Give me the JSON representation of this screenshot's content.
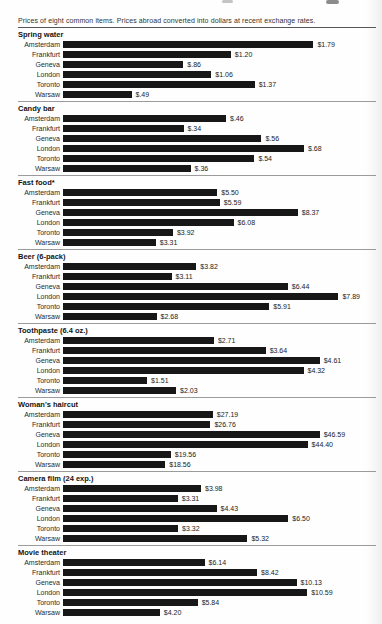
{
  "page": {
    "caption": "Prices of eight common items. Prices abroad converted into dollars at recent exchange rates."
  },
  "colors": {
    "bar": "#171717",
    "section_rule": "#9b9b9b",
    "caption_rule": "#565656",
    "text": "#1f1f1f"
  },
  "chart_data": {
    "type": "bar",
    "orientation": "horizontal",
    "title": "Prices of eight common items. Prices abroad converted into dollars at recent exchange rates.",
    "unit": "USD",
    "grid": false,
    "legend": "none",
    "categories": [
      "Amsterdam",
      "Frankfurt",
      "Geneva",
      "London",
      "Toronto",
      "Warsaw"
    ],
    "groups": [
      {
        "label": "Spring water",
        "values": [
          1.79,
          1.2,
          0.86,
          1.06,
          1.37,
          0.49
        ],
        "value_labels": [
          "$1.79",
          "$1.20",
          "$.86",
          "$1.06",
          "$1.37",
          "$.49"
        ],
        "bar_scale": 0.8
      },
      {
        "label": "Candy bar",
        "values": [
          0.46,
          0.34,
          0.56,
          0.68,
          0.54,
          0.36
        ],
        "value_labels": [
          "$.46",
          "$.34",
          "$.56",
          "$.68",
          "$.54",
          "$.36"
        ],
        "bar_scale": 0.77
      },
      {
        "label": "Fast food*",
        "values": [
          5.5,
          5.59,
          8.37,
          6.08,
          3.92,
          3.31
        ],
        "value_labels": [
          "$5.50",
          "$5.59",
          "$8.37",
          "$6.08",
          "$3.92",
          "$3.31"
        ],
        "bar_scale": 0.75
      },
      {
        "label": "Beer (6-pack)",
        "values": [
          3.82,
          3.11,
          6.44,
          7.89,
          5.91,
          2.68
        ],
        "value_labels": [
          "$3.82",
          "$3.11",
          "$6.44",
          "$7.89",
          "$5.91",
          "$2.68"
        ],
        "bar_scale": 0.88
      },
      {
        "label": "Toothpaste (6.4 oz.)",
        "values": [
          2.71,
          3.64,
          4.61,
          4.32,
          1.51,
          2.03
        ],
        "value_labels": [
          "$2.71",
          "$3.64",
          "$4.61",
          "$4.32",
          "$1.51",
          "$2.03"
        ],
        "bar_scale": 0.82
      },
      {
        "label": "Woman's haircut",
        "values": [
          27.19,
          26.76,
          46.59,
          44.4,
          19.56,
          18.56
        ],
        "value_labels": [
          "$27.19",
          "$26.76",
          "$46.59",
          "$44.40",
          "$19.56",
          "$18.56"
        ],
        "bar_scale": 0.82
      },
      {
        "label": "Camera film (24 exp.)",
        "values": [
          3.98,
          3.31,
          4.43,
          6.5,
          3.32,
          5.32
        ],
        "value_labels": [
          "$3.98",
          "$3.31",
          "$4.43",
          "$6.50",
          "$3.32",
          "$5.32"
        ],
        "bar_scale": 0.72
      },
      {
        "label": "Movie theater",
        "values": [
          6.14,
          8.42,
          10.13,
          10.59,
          5.84,
          4.2
        ],
        "value_labels": [
          "$6.14",
          "$8.42",
          "$10.13",
          "$10.59",
          "$5.84",
          "$4.20"
        ],
        "bar_scale": 0.78
      }
    ]
  }
}
